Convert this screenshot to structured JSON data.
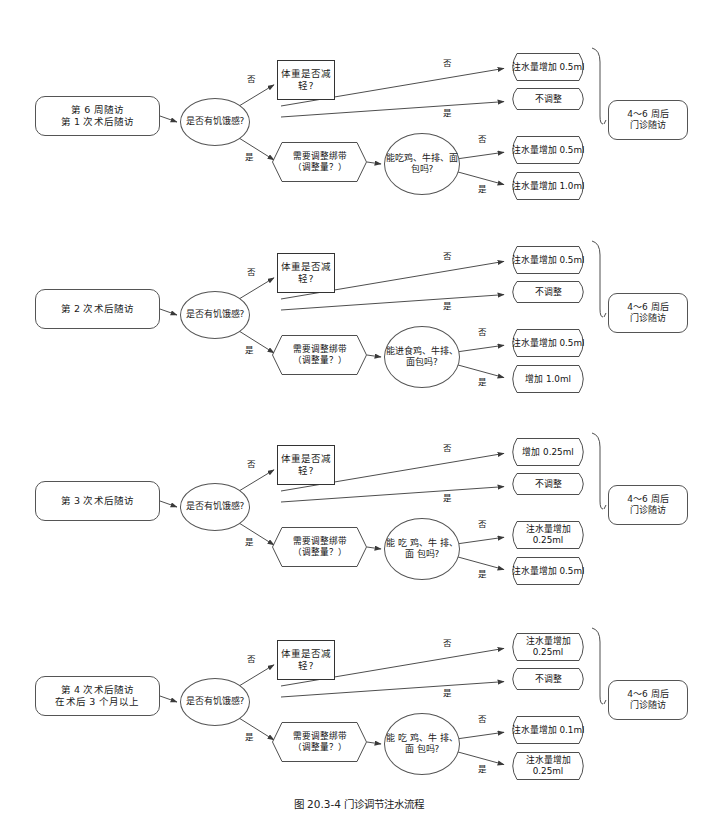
{
  "figure": {
    "caption": "图 20.3-4    门诊调节注水流程",
    "line_color": "#3a3a3a",
    "text_color": "#1a1a1a",
    "background": "#ffffff"
  },
  "common": {
    "hunger_question": "是否有饥饿感?",
    "weight_question": "体重是否减轻?",
    "band_question_line1": "需要调整绑带",
    "band_question_line2": "（调整量？）",
    "label_no": "否",
    "label_yes": "是",
    "end_line1": "4～6 周后",
    "end_line2": "门诊随访",
    "no_change": "不调整"
  },
  "blocks": [
    {
      "id": "visit-1",
      "start_line1": "第 6 周随访",
      "start_line2": "第 1 次术后随访",
      "food_question": "能吃鸡、牛排、面包吗?",
      "weight_no_result": "注水量增加 0.5ml",
      "weight_yes_result": "不调整",
      "food_no_result": "注水量增加 0.5ml",
      "food_yes_result": "注水量增加 1.0ml",
      "end_line1": "4～6 周后",
      "end_line2": "门诊随访"
    },
    {
      "id": "visit-2",
      "start_line1": "第 2 次术后随访",
      "start_line2": "",
      "food_question": "能进食鸡、牛排、面包吗?",
      "weight_no_result": "注水量增加 0.5ml",
      "weight_yes_result": "不调整",
      "food_no_result": "注水量增加 0.5ml",
      "food_yes_result": "增加 1.0ml",
      "end_line1": "4～6 周后",
      "end_line2": "门诊随访"
    },
    {
      "id": "visit-3",
      "start_line1": "第 3 次术后随访",
      "start_line2": "",
      "food_question": "能 吃 鸡、牛 排、面 包吗?",
      "weight_no_result": "增加 0.25ml",
      "weight_yes_result": "不调整",
      "food_no_result": "注水量增加 0.25ml",
      "food_yes_result": "注水量增加 0.5ml",
      "end_line1": "4～6 周后",
      "end_line2": "门诊随访"
    },
    {
      "id": "visit-4",
      "start_line1": "第 4 次术后随访",
      "start_line2": "在术后 3 个月以上",
      "food_question": "能 吃 鸡、牛 排、面 包吗?",
      "weight_no_result": "注水量增加 0.25ml",
      "weight_yes_result": "不调整",
      "food_no_result": "注水量增加 0.1ml",
      "food_yes_result": "注水量增加 0.25ml",
      "end_line1": "4～6 周后",
      "end_line2": "门诊随访"
    }
  ]
}
